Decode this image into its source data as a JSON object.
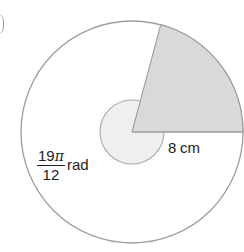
{
  "figure": {
    "type": "circle-sector-diagram",
    "circle": {
      "center": [
        132,
        132
      ],
      "radius": 111,
      "stroke": "#9e9e9e",
      "fill": "#ffffff"
    },
    "shaded_sector": {
      "fill": "#d9d9d9",
      "angle_degrees": 75,
      "start_angle_degrees": 0,
      "end_angle_degrees": 75
    },
    "angle_marker": {
      "radius": 32,
      "fill": "#efefef",
      "stroke": "#a8a8a8"
    },
    "labels": {
      "radius": "8 cm",
      "angle_numerator_number": "19",
      "angle_numerator_symbol": "π",
      "angle_denominator": "12",
      "angle_unit": "rad"
    }
  }
}
